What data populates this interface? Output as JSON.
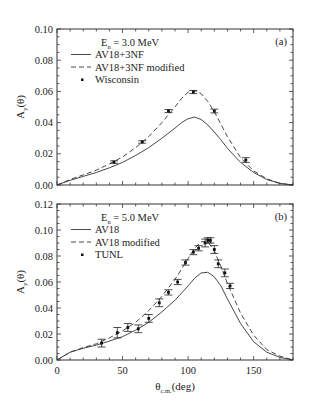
{
  "chart_data": [
    {
      "type": "line",
      "panel_label": "(a)",
      "title": "",
      "annotation": "E_n = 3.0 MeV",
      "energy_label": {
        "main": "E",
        "sub": "n",
        "rest": "= 3.0 MeV"
      },
      "xlabel": "θ_c.m.(deg)",
      "ylabel": "A_y(θ)",
      "xlim": [
        0,
        180
      ],
      "ylim": [
        0.0,
        0.1
      ],
      "yticks": [
        "0.00",
        "0.02",
        "0.04",
        "0.06",
        "0.08",
        "0.10"
      ],
      "xticks": [],
      "grid": false,
      "legend_position": "upper left",
      "series": [
        {
          "name": "AV18+3NF",
          "style": "solid",
          "x": [
            0,
            10,
            20,
            30,
            40,
            50,
            60,
            70,
            80,
            90,
            95,
            100,
            105,
            110,
            115,
            120,
            125,
            130,
            140,
            150,
            160,
            170,
            180
          ],
          "values": [
            0.0,
            0.003,
            0.0055,
            0.008,
            0.011,
            0.0145,
            0.019,
            0.024,
            0.03,
            0.0365,
            0.04,
            0.0425,
            0.0435,
            0.042,
            0.0385,
            0.034,
            0.029,
            0.0235,
            0.0145,
            0.008,
            0.0035,
            0.001,
            0.0
          ]
        },
        {
          "name": "AV18+3NF modified",
          "style": "dashed",
          "x": [
            0,
            10,
            20,
            30,
            40,
            50,
            60,
            70,
            80,
            90,
            95,
            100,
            105,
            110,
            115,
            120,
            125,
            130,
            140,
            150,
            160,
            170,
            180
          ],
          "values": [
            0.0,
            0.0035,
            0.0065,
            0.0095,
            0.0135,
            0.018,
            0.024,
            0.031,
            0.04,
            0.05,
            0.0555,
            0.0595,
            0.0605,
            0.0585,
            0.0535,
            0.047,
            0.039,
            0.031,
            0.0175,
            0.009,
            0.004,
            0.001,
            0.0
          ]
        },
        {
          "name": "Wisconsin",
          "style": "markers",
          "x": [
            43.5,
            65,
            85,
            104,
            120,
            144
          ],
          "values": [
            0.0147,
            0.0276,
            0.0474,
            0.0596,
            0.0474,
            0.016
          ],
          "errors": [
            0.0008,
            0.0008,
            0.001,
            0.001,
            0.0012,
            0.0015
          ]
        }
      ]
    },
    {
      "type": "line",
      "panel_label": "(b)",
      "title": "",
      "annotation": "E_n = 5.0 MeV",
      "energy_label": {
        "main": "E",
        "sub": "n",
        "rest": "= 5.0 MeV"
      },
      "xlabel": "θ_c.m.(deg)",
      "ylabel": "A_y(θ)",
      "xlim": [
        0,
        180
      ],
      "ylim": [
        0.0,
        0.12
      ],
      "yticks": [
        "0.00",
        "0.02",
        "0.04",
        "0.06",
        "0.08",
        "0.10",
        "0.12"
      ],
      "xticks": [
        "0",
        "50",
        "100",
        "150"
      ],
      "grid": false,
      "legend_position": "upper left",
      "series": [
        {
          "name": "AV18",
          "style": "solid",
          "x": [
            0,
            10,
            20,
            30,
            40,
            50,
            60,
            70,
            80,
            90,
            100,
            105,
            110,
            115,
            120,
            125,
            130,
            140,
            150,
            160,
            170,
            180
          ],
          "values": [
            0.0,
            0.006,
            0.009,
            0.0115,
            0.0145,
            0.018,
            0.023,
            0.029,
            0.037,
            0.046,
            0.057,
            0.063,
            0.067,
            0.0675,
            0.064,
            0.057,
            0.047,
            0.028,
            0.014,
            0.006,
            0.002,
            0.0
          ]
        },
        {
          "name": "AV18 modified",
          "style": "dashed",
          "x": [
            0,
            10,
            20,
            30,
            40,
            50,
            60,
            70,
            80,
            90,
            100,
            105,
            110,
            115,
            120,
            125,
            130,
            140,
            150,
            160,
            170,
            180
          ],
          "values": [
            0.0,
            0.006,
            0.0095,
            0.0125,
            0.017,
            0.0225,
            0.029,
            0.038,
            0.049,
            0.062,
            0.078,
            0.086,
            0.091,
            0.091,
            0.084,
            0.072,
            0.059,
            0.036,
            0.019,
            0.008,
            0.003,
            0.0
          ]
        },
        {
          "name": "TUNL",
          "style": "markers",
          "x": [
            34,
            46,
            54,
            62,
            70,
            78,
            85,
            92,
            98,
            104,
            108,
            113,
            115,
            117,
            120,
            123,
            128,
            132
          ],
          "values": [
            0.013,
            0.021,
            0.025,
            0.024,
            0.032,
            0.044,
            0.052,
            0.06,
            0.075,
            0.083,
            0.086,
            0.09,
            0.092,
            0.092,
            0.085,
            0.074,
            0.067,
            0.057
          ],
          "errors": [
            0.003,
            0.004,
            0.003,
            0.003,
            0.003,
            0.003,
            0.002,
            0.002,
            0.002,
            0.002,
            0.002,
            0.003,
            0.002,
            0.002,
            0.003,
            0.003,
            0.003,
            0.002
          ]
        }
      ]
    }
  ],
  "axis_labels": {
    "x_main": "θ",
    "x_sub": "c.m.",
    "x_rest": "(deg)",
    "y_main": "A",
    "y_sub": "y",
    "y_rest": "(θ)"
  }
}
